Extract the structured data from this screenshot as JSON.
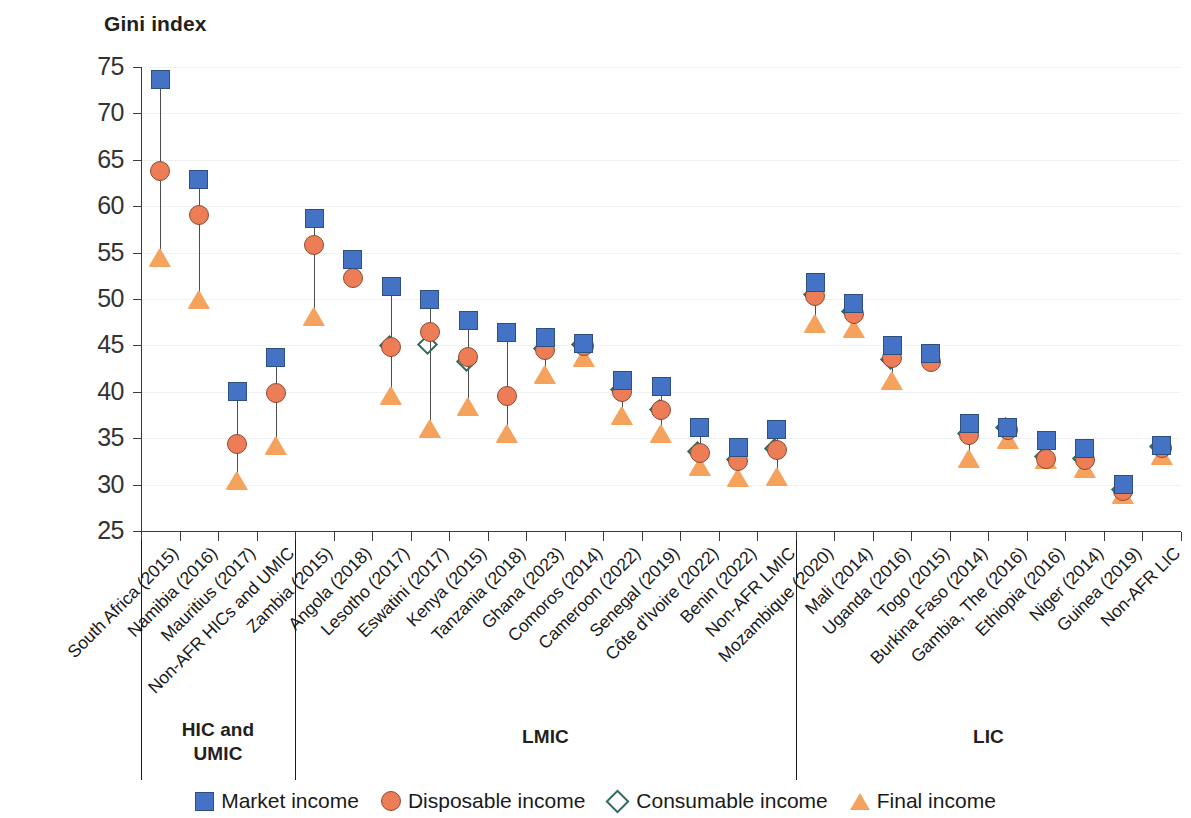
{
  "chart_data": {
    "type": "scatter",
    "title": "",
    "ylabel": "Gini index",
    "xlabel": "",
    "ylim": [
      25,
      75
    ],
    "yticks": [
      25,
      30,
      35,
      40,
      45,
      50,
      55,
      60,
      65,
      70,
      75
    ],
    "grid": true,
    "legend_position": "bottom",
    "legend": [
      {
        "name": "Market income",
        "marker": "square",
        "color": "#4472c4"
      },
      {
        "name": "Disposable income",
        "marker": "circle",
        "color": "#ed7d57"
      },
      {
        "name": "Consumable income",
        "marker": "diamond-open",
        "color": "#2f6b5e"
      },
      {
        "name": "Final income",
        "marker": "triangle",
        "color": "#f5a25d"
      }
    ],
    "categories": [
      "South Africa (2015)",
      "Namibia (2016)",
      "Mauritius (2017)",
      "Non-AFR HICs and UMIC",
      "Zambia (2015)",
      "Angola (2018)",
      "Lesotho (2017)",
      "Eswatini (2017)",
      "Kenya (2015)",
      "Tanzania (2018)",
      "Ghana (2023)",
      "Comoros (2014)",
      "Cameroon (2022)",
      "Senegal (2019)",
      "Côte d'Ivoire (2022)",
      "Benin (2022)",
      "Non-AFR LMIC",
      "Mozambique (2020)",
      "Mali (2014)",
      "Uganda (2016)",
      "Togo (2015)",
      "Burkina Faso (2014)",
      "Gambia, The (2016)",
      "Ethiopia (2016)",
      "Niger (2014)",
      "Guinea (2019)",
      "Non-AFR LIC"
    ],
    "series": [
      {
        "name": "Market income",
        "values": [
          73.7,
          62.9,
          40.0,
          43.7,
          58.7,
          54.3,
          51.4,
          49.9,
          47.7,
          46.4,
          45.8,
          45.2,
          41.2,
          40.6,
          36.2,
          34.0,
          35.9,
          51.8,
          49.5,
          45.0,
          44.1,
          36.6,
          36.2,
          34.7,
          33.9,
          30.0,
          34.2
        ]
      },
      {
        "name": "Disposable income",
        "values": [
          63.8,
          59.1,
          34.4,
          39.9,
          55.8,
          52.3,
          44.8,
          46.4,
          43.7,
          39.5,
          44.5,
          44.9,
          40.0,
          38.0,
          33.4,
          32.5,
          33.7,
          50.3,
          48.4,
          43.6,
          43.2,
          35.3,
          35.9,
          32.8,
          32.6,
          29.3,
          33.9
        ]
      },
      {
        "name": "Consumable income",
        "values": [
          null,
          null,
          null,
          null,
          null,
          null,
          44.8,
          44.9,
          43.0,
          null,
          44.4,
          44.9,
          40.0,
          37.9,
          33.4,
          32.5,
          33.7,
          50.3,
          48.4,
          43.3,
          null,
          35.3,
          35.9,
          32.8,
          32.6,
          29.3,
          33.9
        ]
      },
      {
        "name": "Final income",
        "values": [
          54.4,
          49.9,
          30.4,
          34.2,
          48.1,
          null,
          39.6,
          36.0,
          38.4,
          35.5,
          41.8,
          43.6,
          37.4,
          35.4,
          31.9,
          30.7,
          30.8,
          47.3,
          46.8,
          41.2,
          null,
          32.8,
          34.8,
          32.6,
          31.7,
          28.9,
          33.1
        ]
      }
    ],
    "group_separators": [
      {
        "after_index": -1
      },
      {
        "after_index": 3
      },
      {
        "after_index": 16
      }
    ],
    "groups": [
      {
        "label": "HIC and\nUMIC",
        "start": 0,
        "end": 3
      },
      {
        "label": "LMIC",
        "start": 4,
        "end": 16
      },
      {
        "label": "LIC",
        "start": 17,
        "end": 26
      }
    ]
  }
}
